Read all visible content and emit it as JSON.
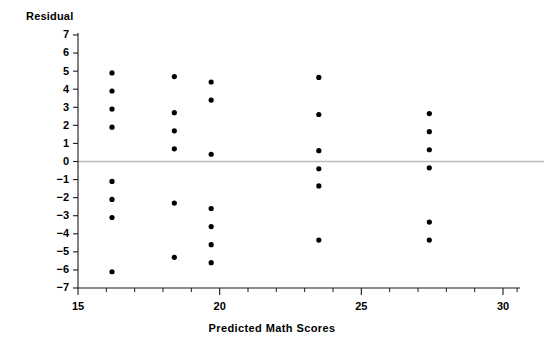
{
  "chart_data": {
    "type": "scatter",
    "title": "",
    "xlabel": "Predicted Math Scores",
    "ylabel": "Residual",
    "xlim": [
      15,
      30.6
    ],
    "ylim": [
      -7,
      7
    ],
    "grid": false,
    "legend": null,
    "reference_line": {
      "orientation": "horizontal",
      "y": 0,
      "color": "#bdbdbd"
    },
    "x_ticks_major": [
      15,
      20,
      25,
      30
    ],
    "x_tick_labels": [
      "15",
      "20",
      "25",
      "30"
    ],
    "x_ticks_minor": [
      16,
      17,
      18,
      19,
      21,
      22,
      23,
      24,
      26,
      27,
      28,
      29,
      30.5
    ],
    "y_ticks": [
      7,
      6,
      5,
      4,
      3,
      2,
      1,
      0,
      -1,
      -2,
      -3,
      -4,
      -5,
      -6,
      -7
    ],
    "y_tick_labels": [
      "7",
      "6",
      "5",
      "4",
      "3",
      "2",
      "1",
      "0",
      "−1",
      "−2",
      "−3",
      "−4",
      "−5",
      "−6",
      "−7"
    ],
    "marker": {
      "shape": "circle",
      "size": 2.6,
      "color": "#000000"
    },
    "points": [
      {
        "x": 16.2,
        "y": 4.9
      },
      {
        "x": 16.2,
        "y": 3.9
      },
      {
        "x": 16.2,
        "y": 2.9
      },
      {
        "x": 16.2,
        "y": 1.9
      },
      {
        "x": 16.2,
        "y": -1.1
      },
      {
        "x": 16.2,
        "y": -2.1
      },
      {
        "x": 16.2,
        "y": -3.1
      },
      {
        "x": 16.2,
        "y": -6.1
      },
      {
        "x": 18.4,
        "y": 4.7
      },
      {
        "x": 18.4,
        "y": 2.7
      },
      {
        "x": 18.4,
        "y": 1.7
      },
      {
        "x": 18.4,
        "y": 0.7
      },
      {
        "x": 18.4,
        "y": -2.3
      },
      {
        "x": 18.4,
        "y": -5.3
      },
      {
        "x": 19.7,
        "y": 4.4
      },
      {
        "x": 19.7,
        "y": 3.4
      },
      {
        "x": 19.7,
        "y": 0.4
      },
      {
        "x": 19.7,
        "y": -2.6
      },
      {
        "x": 19.7,
        "y": -3.6
      },
      {
        "x": 19.7,
        "y": -4.6
      },
      {
        "x": 19.7,
        "y": -5.6
      },
      {
        "x": 23.5,
        "y": 4.65
      },
      {
        "x": 23.5,
        "y": 2.6
      },
      {
        "x": 23.5,
        "y": 0.6
      },
      {
        "x": 23.5,
        "y": -0.4
      },
      {
        "x": 23.5,
        "y": -1.35
      },
      {
        "x": 23.5,
        "y": -4.35
      },
      {
        "x": 27.4,
        "y": 2.65
      },
      {
        "x": 27.4,
        "y": 1.65
      },
      {
        "x": 27.4,
        "y": 0.65
      },
      {
        "x": 27.4,
        "y": -0.35
      },
      {
        "x": 27.4,
        "y": -3.35
      },
      {
        "x": 27.4,
        "y": -4.35
      }
    ]
  },
  "axes": {
    "y_title": "Residual",
    "x_title_words": [
      "Predicted",
      "Math",
      "Scores"
    ]
  }
}
